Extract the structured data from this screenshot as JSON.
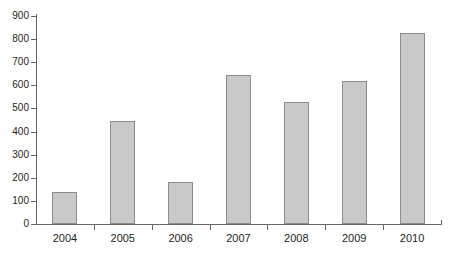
{
  "chart_data": {
    "type": "bar",
    "title": "",
    "subtitle": "",
    "xlabel": "",
    "ylabel": "",
    "categories": [
      "2004",
      "2005",
      "2006",
      "2007",
      "2008",
      "2009",
      "2010"
    ],
    "values": [
      140,
      445,
      180,
      645,
      530,
      620,
      825
    ],
    "ylim": [
      0,
      900
    ],
    "ytick_step": 100,
    "yticks": [
      "0",
      "100",
      "200",
      "300",
      "400",
      "500",
      "600",
      "700",
      "800",
      "900"
    ],
    "grid": false,
    "legend": null,
    "legend_position": "none",
    "annotations": [],
    "series": [
      {
        "name": "",
        "values": [
          140,
          445,
          180,
          645,
          530,
          620,
          825
        ]
      }
    ],
    "colors": {
      "bar_fill": "#c9c9c9",
      "bar_border": "#8c8c8c",
      "axis": "#666666",
      "text": "#231f20",
      "background": "#ffffff"
    }
  }
}
